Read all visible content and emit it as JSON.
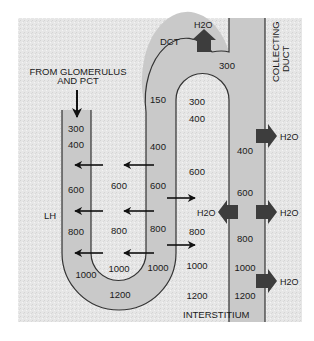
{
  "colors": {
    "background_panel": "#e9e9e9",
    "tubule_fill": "#c8c8c8",
    "outline": "#333333",
    "water_arrow": "#3d3d3d",
    "text": "#1a1a1a"
  },
  "labels": {
    "source": [
      "FROM GLOMERULUS",
      "AND PCT"
    ],
    "loop_of_henle": "LH",
    "dct": "DCT",
    "collecting_duct": [
      "COLLECTING",
      "DUCT"
    ],
    "interstitium": "INTERSTITIUM",
    "water": "H2O",
    "water_subscript_note": "H₂0 shown as H20"
  },
  "descending_limb": {
    "values": [
      "300",
      "400",
      "600",
      "800",
      "1000"
    ]
  },
  "interstitium_inner": {
    "values": [
      "600",
      "800",
      "1000"
    ]
  },
  "ascending_limb": {
    "values": [
      "150",
      "400",
      "600",
      "800",
      "1000"
    ]
  },
  "loop_bottom": {
    "value": "1200"
  },
  "dct_arch": {
    "value": "300"
  },
  "interstitium_right": {
    "values": [
      "300",
      "400",
      "600",
      "800",
      "1000",
      "1200"
    ]
  },
  "collecting_duct_values": {
    "values": [
      "400",
      "600",
      "800",
      "1000",
      "1200"
    ]
  },
  "water_flows": [
    {
      "location": "dct-top",
      "direction": "up",
      "label": "H20"
    },
    {
      "location": "collecting-duct-upper",
      "direction": "right",
      "label": "H20"
    },
    {
      "location": "collecting-duct-middle-left",
      "direction": "left",
      "label": "H20"
    },
    {
      "location": "collecting-duct-middle-right",
      "direction": "right",
      "label": "H20"
    },
    {
      "location": "collecting-duct-lower",
      "direction": "right",
      "label": "H20"
    }
  ],
  "solute_arrows": {
    "from_ascending_to_descending": 3,
    "from_descending_into_limb": 3,
    "from_ascending_to_interstitium": 2
  }
}
